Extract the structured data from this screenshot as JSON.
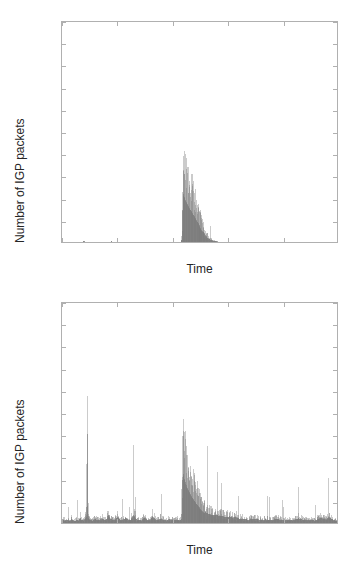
{
  "figure": {
    "width": 359,
    "height": 562,
    "background": "#ffffff",
    "data_color": "#7a7a7a",
    "axis_color": "#b0b0b0",
    "text_color": "#262626"
  },
  "panels": [
    {
      "id": "top",
      "name": "igp-packets-chart-top",
      "chart_data": {
        "type": "area",
        "title": "",
        "subtitle": "",
        "xlabel": "Time",
        "ylabel": "Number of IGP packets",
        "xtick_labels": [
          "01/23",
          "01/24",
          "01/25",
          "01/26",
          "01/27",
          "01/28"
        ],
        "xtick_values": [
          0,
          1,
          2,
          3,
          4,
          5
        ],
        "ytick_labels": [
          "0",
          "200",
          "400",
          "600",
          "800",
          "1000",
          "1200",
          "1400",
          "1600",
          "1800",
          "2000"
        ],
        "ytick_values": [
          0,
          200,
          400,
          600,
          800,
          1000,
          1200,
          1400,
          1600,
          1800,
          2000
        ],
        "xlim": [
          0,
          5
        ],
        "ylim": [
          0,
          2000
        ],
        "grid": false,
        "legend": "none",
        "annotations": [
          "Near-zero baseline across whole window",
          "Single burst starting 01/25.2 peaking ~1060 packets, decaying to zero by 01/25.6",
          "Faint low-amplitude vertical traces near 01/23.4 and 01/23.9"
        ],
        "series": [
          {
            "name": "IGP packets (filtered)",
            "color": "#7a7a7a",
            "x": [
              0.0,
              0.1,
              0.2,
              0.3,
              0.38,
              0.4,
              0.42,
              0.5,
              0.6,
              0.7,
              0.8,
              0.88,
              0.9,
              0.92,
              1.0,
              1.1,
              1.2,
              1.3,
              1.4,
              1.5,
              1.6,
              1.7,
              1.8,
              1.9,
              2.0,
              2.1,
              2.14,
              2.16,
              2.18,
              2.19,
              2.2,
              2.21,
              2.22,
              2.24,
              2.26,
              2.28,
              2.3,
              2.32,
              2.34,
              2.36,
              2.38,
              2.4,
              2.42,
              2.44,
              2.46,
              2.48,
              2.5,
              2.52,
              2.54,
              2.56,
              2.58,
              2.6,
              2.62,
              2.65,
              2.7,
              2.8,
              2.9,
              3.0,
              3.2,
              3.4,
              3.6,
              3.8,
              4.0,
              4.2,
              4.4,
              4.6,
              4.8,
              5.0
            ],
            "y": [
              0,
              0,
              0,
              0,
              0,
              18,
              0,
              0,
              0,
              0,
              0,
              0,
              12,
              0,
              0,
              0,
              0,
              0,
              0,
              0,
              0,
              0,
              0,
              0,
              0,
              0,
              0,
              2,
              40,
              520,
              1060,
              1010,
              980,
              900,
              860,
              820,
              760,
              720,
              680,
              640,
              600,
              560,
              520,
              470,
              430,
              390,
              340,
              300,
              260,
              215,
              175,
              140,
              110,
              75,
              40,
              10,
              0,
              0,
              0,
              0,
              0,
              0,
              0,
              0,
              0,
              0,
              0,
              0
            ]
          }
        ]
      }
    },
    {
      "id": "bottom",
      "name": "igp-packets-chart-bottom",
      "chart_data": {
        "type": "area",
        "title": "",
        "subtitle": "",
        "xlabel": "Time",
        "ylabel": "Number of IGP packets",
        "xtick_labels": [
          "01/23",
          "01/24",
          "01/25",
          "01/26",
          "01/27",
          "01/28"
        ],
        "xtick_values": [
          0,
          1,
          2,
          3,
          4,
          5
        ],
        "ytick_labels": [
          "0",
          "200",
          "400",
          "600",
          "800",
          "1000",
          "1200",
          "1400",
          "1600",
          "1800",
          "2000"
        ],
        "ytick_values": [
          0,
          200,
          400,
          600,
          800,
          1000,
          1200,
          1400,
          1600,
          1800,
          2000
        ],
        "xlim": [
          0,
          5
        ],
        "ylim": [
          0,
          2000
        ],
        "grid": false,
        "legend": "none",
        "annotations": [
          "Continuous noisy baseline roughly 10-60 packets across the whole window",
          "Tall narrow spike near 01/23.5 reaching ~1980 packets",
          "Main burst starting 01/25.2 peaking ~1080 packets with long decay tail to 01/26",
          "Elevated residual noise up to ~150 packets between 01/25.6 and 01/26.2"
        ],
        "series": [
          {
            "name": "IGP packets (unfiltered)",
            "color": "#7a7a7a",
            "baseline_noise": {
              "min": 5,
              "max": 60,
              "typical": 25
            },
            "x": [
              0.0,
              0.03,
              0.06,
              0.09,
              0.12,
              0.15,
              0.18,
              0.21,
              0.24,
              0.27,
              0.3,
              0.33,
              0.36,
              0.39,
              0.42,
              0.45,
              0.46,
              0.47,
              0.48,
              0.5,
              0.53,
              0.56,
              0.6,
              0.64,
              0.68,
              0.72,
              0.76,
              0.8,
              0.84,
              0.88,
              0.92,
              0.96,
              1.0,
              1.05,
              1.1,
              1.15,
              1.2,
              1.25,
              1.3,
              1.35,
              1.4,
              1.45,
              1.5,
              1.55,
              1.6,
              1.65,
              1.7,
              1.75,
              1.8,
              1.85,
              1.9,
              1.95,
              2.0,
              2.05,
              2.1,
              2.14,
              2.17,
              2.18,
              2.19,
              2.2,
              2.21,
              2.22,
              2.24,
              2.26,
              2.28,
              2.3,
              2.33,
              2.36,
              2.39,
              2.42,
              2.45,
              2.48,
              2.51,
              2.54,
              2.57,
              2.6,
              2.64,
              2.68,
              2.72,
              2.76,
              2.8,
              2.85,
              2.9,
              2.95,
              3.0,
              3.05,
              3.1,
              3.15,
              3.2,
              3.3,
              3.4,
              3.5,
              3.6,
              3.7,
              3.8,
              3.9,
              4.0,
              4.1,
              4.2,
              4.3,
              4.4,
              4.5,
              4.6,
              4.7,
              4.8,
              4.85,
              4.9,
              4.95,
              5.0
            ],
            "y": [
              30,
              55,
              38,
              62,
              45,
              35,
              70,
              48,
              36,
              58,
              42,
              90,
              52,
              44,
              68,
              120,
              1980,
              240,
              95,
              60,
              48,
              40,
              72,
              55,
              46,
              88,
              60,
              52,
              140,
              72,
              58,
              46,
              110,
              64,
              50,
              92,
              58,
              46,
              150,
              70,
              54,
              44,
              96,
              58,
              46,
              120,
              62,
              48,
              80,
              54,
              44,
              70,
              52,
              46,
              60,
              45,
              70,
              330,
              860,
              1080,
              1020,
              960,
              880,
              800,
              740,
              690,
              620,
              560,
              500,
              450,
              400,
              355,
              310,
              270,
              235,
              205,
              180,
              160,
              150,
              145,
              140,
              135,
              125,
              115,
              105,
              120,
              95,
              110,
              85,
              70,
              60,
              80,
              55,
              65,
              48,
              72,
              55,
              60,
              45,
              85,
              52,
              60,
              42,
              95,
              58,
              110,
              70,
              48,
              38,
              25
            ]
          }
        ]
      }
    }
  ]
}
